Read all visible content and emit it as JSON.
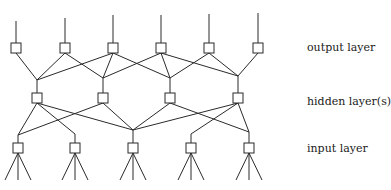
{
  "diagram": {
    "type": "neural-network-architecture",
    "labels": {
      "output": "output layer",
      "hidden": "hidden layer(s)",
      "input": "input layer"
    },
    "colors": {
      "stroke": "#2a2a2a",
      "background": "#ffffff",
      "text": "#1a1a1a"
    },
    "layers": {
      "output": {
        "nodes": [
          {
            "x": 16,
            "top": 21
          },
          {
            "x": 65,
            "top": 18
          },
          {
            "x": 113,
            "top": 15
          },
          {
            "x": 161,
            "top": 15
          },
          {
            "x": 209,
            "top": 14
          },
          {
            "x": 258,
            "top": 13
          }
        ],
        "y": 43
      },
      "hidden": {
        "nodes": [
          {
            "x": 37,
            "join": 80
          },
          {
            "x": 103,
            "join": 78
          },
          {
            "x": 170,
            "join": 78
          },
          {
            "x": 238,
            "join": 76
          }
        ],
        "y": 93
      },
      "input": {
        "nodes": [
          {
            "x": 18,
            "join": 135
          },
          {
            "x": 75,
            "join": 134
          },
          {
            "x": 133,
            "join": 130
          },
          {
            "x": 191,
            "join": 134
          },
          {
            "x": 249,
            "join": 132
          }
        ],
        "y": 143,
        "fan_bottom": 180
      }
    },
    "output_to_hidden": [
      [
        0
      ],
      [
        0,
        1
      ],
      [
        0,
        1,
        2
      ],
      [
        1,
        2,
        3
      ],
      [
        2,
        3
      ],
      [
        3
      ]
    ],
    "hidden_to_input": [
      [
        0,
        1,
        2
      ],
      [
        0,
        2
      ],
      [
        2,
        4
      ],
      [
        2,
        3,
        4
      ]
    ]
  }
}
